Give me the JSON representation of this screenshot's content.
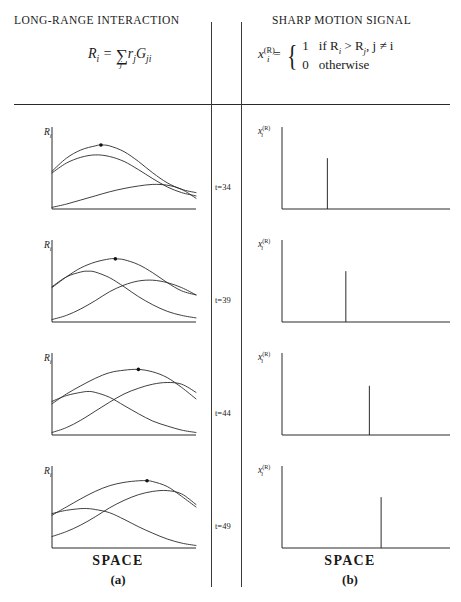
{
  "figure": {
    "columns": {
      "left": {
        "title": "LONG-RANGE INTERACTION",
        "formula_text": "R_i = sum_j r_j G_ji",
        "formula": {
          "lhs_base": "R",
          "lhs_sub": "i",
          "equals": "=",
          "sum_symbol": "∑",
          "sum_index": "j",
          "term1_base": "r",
          "term1_sub": "j",
          "term2_base": "G",
          "term2_sub": "ji"
        },
        "axis_label": "R",
        "axis_label_sub": "i",
        "caption_main": "SPACE",
        "caption_tag": "(a)"
      },
      "right": {
        "title": "SHARP MOTION SIGNAL",
        "formula_text": "x_i^(R) = { 1 if R_i > R_j, j != i ; 0 otherwise }",
        "formula": {
          "lhs_base": "x",
          "lhs_sub": "i",
          "lhs_sup": "(R)",
          "equals": "=",
          "case1_value": "1",
          "case1_condition": "if R",
          "case1_condition_sub1": "i",
          "case1_condition_mid": " > R",
          "case1_condition_sub2": "j",
          "case1_condition_tail": ", j ≠ i",
          "case2_value": "0",
          "case2_condition": "otherwise"
        },
        "axis_label": "x",
        "axis_label_sub": "i",
        "axis_label_sup": "(R)",
        "caption_main": "SPACE",
        "caption_tag": "(b)"
      }
    },
    "time_labels": [
      "t=34",
      "t=39",
      "t=44",
      "t=49"
    ],
    "colors": {
      "ink": "#1a1a1a",
      "curve": "#2a2a2a",
      "axis": "#2a2a2a",
      "rule": "#2a2a2a",
      "marker": "#111111"
    }
  },
  "chart_data": [
    {
      "type": "line",
      "panel": "a",
      "time": "t=34",
      "title": "LONG-RANGE INTERACTION",
      "xlabel": "SPACE",
      "ylabel": "R_i",
      "xlim": [
        0,
        100
      ],
      "ylim": [
        0,
        100
      ],
      "grid": false,
      "legend": "none",
      "peak_marker_x": 34,
      "peak_marker_y": 78,
      "series": [
        {
          "name": "curve-1",
          "x": [
            0,
            10,
            20,
            30,
            34,
            40,
            50,
            60,
            70,
            80,
            90,
            100
          ],
          "values": [
            46,
            62,
            72,
            77,
            78,
            77,
            70,
            58,
            44,
            32,
            24,
            20
          ]
        },
        {
          "name": "curve-2",
          "x": [
            0,
            10,
            20,
            30,
            40,
            50,
            60,
            70,
            80,
            90,
            100
          ],
          "values": [
            44,
            56,
            63,
            66,
            64,
            58,
            48,
            37,
            27,
            20,
            16
          ]
        },
        {
          "name": "curve-3",
          "x": [
            0,
            10,
            20,
            30,
            40,
            50,
            60,
            70,
            80,
            90,
            100
          ],
          "values": [
            2,
            6,
            11,
            16,
            21,
            25,
            28,
            30,
            29,
            24,
            13
          ]
        }
      ]
    },
    {
      "type": "line",
      "panel": "a",
      "time": "t=39",
      "xlabel": "SPACE",
      "ylabel": "R_i",
      "xlim": [
        0,
        100
      ],
      "ylim": [
        0,
        100
      ],
      "grid": false,
      "peak_marker_x": 44,
      "peak_marker_y": 77,
      "series": [
        {
          "name": "curve-1",
          "x": [
            0,
            10,
            20,
            30,
            40,
            44,
            50,
            60,
            70,
            80,
            90,
            100
          ],
          "values": [
            42,
            55,
            66,
            73,
            77,
            77,
            76,
            70,
            60,
            48,
            38,
            33
          ]
        },
        {
          "name": "curve-2",
          "x": [
            0,
            10,
            20,
            25,
            30,
            40,
            50,
            60,
            70,
            80,
            90,
            100
          ],
          "values": [
            43,
            55,
            61,
            62,
            61,
            54,
            43,
            31,
            21,
            13,
            8,
            5
          ]
        },
        {
          "name": "curve-3",
          "x": [
            0,
            10,
            20,
            30,
            40,
            50,
            60,
            70,
            80,
            90,
            100
          ],
          "values": [
            3,
            8,
            16,
            26,
            37,
            45,
            50,
            51,
            48,
            42,
            33
          ]
        }
      ]
    },
    {
      "type": "line",
      "panel": "a",
      "time": "t=44",
      "xlabel": "SPACE",
      "ylabel": "R_i",
      "xlim": [
        0,
        100
      ],
      "ylim": [
        0,
        100
      ],
      "grid": false,
      "peak_marker_x": 60,
      "peak_marker_y": 80,
      "series": [
        {
          "name": "curve-1",
          "x": [
            0,
            10,
            20,
            30,
            40,
            50,
            60,
            70,
            80,
            90,
            100
          ],
          "values": [
            38,
            50,
            60,
            69,
            76,
            79,
            80,
            77,
            70,
            58,
            44
          ]
        },
        {
          "name": "curve-2",
          "x": [
            0,
            10,
            20,
            25,
            30,
            40,
            50,
            60,
            70,
            80,
            90,
            100
          ],
          "values": [
            41,
            48,
            52,
            53,
            52,
            46,
            36,
            26,
            17,
            11,
            6,
            3
          ]
        },
        {
          "name": "curve-3",
          "x": [
            0,
            10,
            20,
            30,
            40,
            50,
            60,
            70,
            80,
            90,
            100
          ],
          "values": [
            3,
            9,
            18,
            29,
            40,
            50,
            57,
            62,
            64,
            62,
            52
          ]
        }
      ]
    },
    {
      "type": "line",
      "panel": "a",
      "time": "t=49",
      "xlabel": "SPACE",
      "ylabel": "R_i",
      "xlim": [
        0,
        100
      ],
      "ylim": [
        0,
        100
      ],
      "grid": false,
      "peak_marker_x": 66,
      "peak_marker_y": 82,
      "series": [
        {
          "name": "curve-1",
          "x": [
            0,
            10,
            20,
            30,
            40,
            50,
            60,
            66,
            70,
            80,
            90,
            100
          ],
          "values": [
            40,
            50,
            60,
            69,
            76,
            80,
            82,
            82,
            81,
            75,
            63,
            50
          ]
        },
        {
          "name": "curve-2",
          "x": [
            0,
            10,
            20,
            25,
            30,
            40,
            50,
            60,
            70,
            80,
            90,
            100
          ],
          "values": [
            42,
            46,
            48,
            48,
            47,
            43,
            35,
            26,
            18,
            11,
            6,
            3
          ]
        },
        {
          "name": "curve-3",
          "x": [
            0,
            10,
            20,
            30,
            40,
            50,
            60,
            70,
            80,
            90,
            100
          ],
          "values": [
            14,
            20,
            28,
            38,
            49,
            58,
            65,
            69,
            70,
            66,
            53
          ]
        }
      ]
    },
    {
      "type": "bar",
      "panel": "b",
      "time": "t=34",
      "title": "SHARP MOTION SIGNAL",
      "xlabel": "SPACE",
      "ylabel": "x_i^(R)",
      "xlim": [
        0,
        100
      ],
      "ylim": [
        0,
        1
      ],
      "grid": false,
      "categories": [
        27
      ],
      "values": [
        0.62
      ],
      "note": "single unit spike at winner location"
    },
    {
      "type": "bar",
      "panel": "b",
      "time": "t=39",
      "xlabel": "SPACE",
      "ylabel": "x_i^(R)",
      "xlim": [
        0,
        100
      ],
      "ylim": [
        0,
        1
      ],
      "grid": false,
      "categories": [
        38
      ],
      "values": [
        0.62
      ]
    },
    {
      "type": "bar",
      "panel": "b",
      "time": "t=44",
      "xlabel": "SPACE",
      "ylabel": "x_i^(R)",
      "xlim": [
        0,
        100
      ],
      "ylim": [
        0,
        1
      ],
      "grid": false,
      "categories": [
        52
      ],
      "values": [
        0.6
      ]
    },
    {
      "type": "bar",
      "panel": "b",
      "time": "t=49",
      "xlabel": "SPACE",
      "ylabel": "x_i^(R)",
      "xlim": [
        0,
        100
      ],
      "ylim": [
        0,
        1
      ],
      "grid": false,
      "categories": [
        59
      ],
      "values": [
        0.62
      ]
    }
  ]
}
